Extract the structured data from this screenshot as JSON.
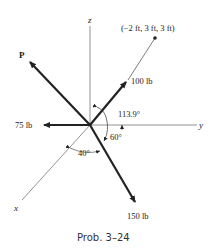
{
  "figure": {
    "caption": "Prob. 3–24",
    "axes": {
      "x": "x",
      "y": "y",
      "z": "z"
    },
    "point_label": "(−2 ft, 3 ft, 3 ft)",
    "forces": [
      {
        "id": "P",
        "label": "P"
      },
      {
        "id": "F100",
        "label": "100 lb"
      },
      {
        "id": "F75",
        "label": "75 lb"
      },
      {
        "id": "F150",
        "label": "150 lb"
      }
    ],
    "angles": [
      {
        "id": "a113",
        "label": "113.9°"
      },
      {
        "id": "a60",
        "label": "60°"
      },
      {
        "id": "a40",
        "label": "40°"
      }
    ]
  }
}
